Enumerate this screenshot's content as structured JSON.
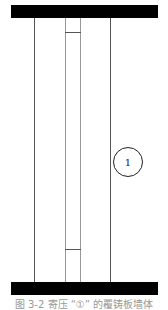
{
  "figure": {
    "marker_label": "1",
    "caption": "图 3-2  寄压 “①” 的覆铸板墙体"
  }
}
